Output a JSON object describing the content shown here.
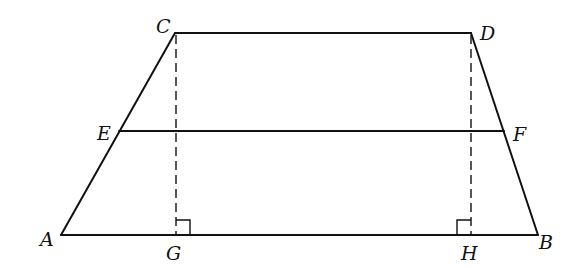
{
  "diagram": {
    "type": "geometry",
    "figure": "trapezoid",
    "stroke_color": "#111111",
    "background": "#ffffff",
    "points": {
      "A": {
        "x": 61,
        "y": 235
      },
      "B": {
        "x": 538,
        "y": 235
      },
      "C": {
        "x": 175,
        "y": 33
      },
      "D": {
        "x": 471,
        "y": 33
      },
      "E": {
        "x": 119,
        "y": 131
      },
      "F": {
        "x": 504,
        "y": 131
      },
      "G": {
        "x": 176,
        "y": 235
      },
      "H": {
        "x": 471,
        "y": 235
      }
    },
    "labels": {
      "A": "A",
      "B": "B",
      "C": "C",
      "D": "D",
      "E": "E",
      "F": "F",
      "G": "G",
      "H": "H"
    },
    "segments": [
      {
        "from": "A",
        "to": "B",
        "style": "solid"
      },
      {
        "from": "A",
        "to": "C",
        "style": "solid"
      },
      {
        "from": "C",
        "to": "D",
        "style": "solid"
      },
      {
        "from": "D",
        "to": "B",
        "style": "solid"
      },
      {
        "from": "E",
        "to": "F",
        "style": "solid"
      },
      {
        "from": "C",
        "to": "G",
        "style": "dashed"
      },
      {
        "from": "D",
        "to": "H",
        "style": "dashed"
      }
    ],
    "right_angles": [
      {
        "at": "G",
        "side": "right"
      },
      {
        "at": "H",
        "side": "left"
      }
    ]
  }
}
